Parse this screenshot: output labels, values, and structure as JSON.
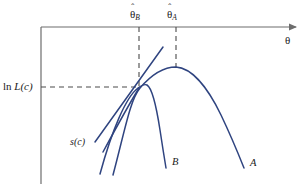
{
  "figure": {
    "title": "",
    "background_color": "#ffffff",
    "axis_color": "#6d6d6d",
    "curve_color": "#2f4480",
    "dash_color": "#555555",
    "text_color": "#1a1a1a"
  },
  "axes": {
    "x_label": "θ",
    "y_label_prefix": "ln ",
    "y_label_italic": "L(c)",
    "origin_x": 41,
    "origin_y": 27,
    "x_axis_y": 27,
    "y_axis_x": 41,
    "arrow_tip_x": 302
  },
  "ticks": [
    {
      "name": "theta-hat-B",
      "symbol": "θ",
      "hat": "ˆ",
      "subscript": "B",
      "x": 139,
      "label_x": 131,
      "label_y": 8,
      "dash_from_y": 27,
      "dash_to_y": 88
    },
    {
      "name": "theta-hat-A",
      "symbol": "θ",
      "hat": "ˆ",
      "subscript": "A",
      "x": 176,
      "label_x": 168,
      "label_y": 8,
      "dash_from_y": 27,
      "dash_to_y": 67
    }
  ],
  "gridlines": {
    "horizontal_dash_y": 87,
    "horizontal_dash_from_x": 41,
    "horizontal_dash_to_x": 140
  },
  "curves": [
    {
      "name": "curve-A",
      "label": "A",
      "label_x": 250,
      "label_y": 159,
      "peak_x": 176,
      "peak_y": 67,
      "end_x": 244,
      "end_y": 168,
      "path": "M 113 175 C 125 130 130 100 140 88 C 152 74 165 67 176 67 C 192 68 208 88 221 115 C 232 138 240 158 244 168"
    },
    {
      "name": "curve-B",
      "label": "B",
      "label_x": 172,
      "label_y": 158,
      "peak_x": 146,
      "peak_y": 84,
      "end_x": 166,
      "end_y": 168,
      "path": "M 100 174 C 112 130 126 97 138 88 C 142 85 145 84 147 85 C 152 88 156 104 160 130 C 163 150 165 162 166 168"
    },
    {
      "name": "score-tangent-line",
      "label": "s(c)",
      "label_x": 72,
      "label_y": 138,
      "start_x": 95,
      "start_y": 142,
      "end_x": 163,
      "end_y": 47,
      "path": "M 95 142 L 163 47"
    },
    {
      "name": "tangency-convergence-strand",
      "label": "",
      "path": "M 103 152 C 115 128 130 101 139 88"
    }
  ],
  "tangency_point": {
    "name": "tangency-point",
    "x": 139,
    "y": 88
  },
  "curve_labels": {
    "a": "A",
    "b": "B",
    "score": "s(c)"
  }
}
